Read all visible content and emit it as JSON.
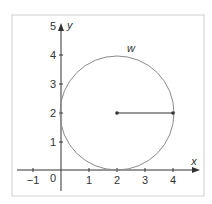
{
  "diagram": {
    "axes": {
      "x_label": "x",
      "y_label": "y",
      "x_ticks": [
        "−1",
        "0",
        "1",
        "2",
        "3",
        "4"
      ],
      "y_ticks": [
        "1",
        "2",
        "3",
        "4",
        "5"
      ]
    },
    "circle": {
      "label": "w",
      "center": [
        2,
        2
      ],
      "radius": 2,
      "radius_endpoint": [
        4,
        2
      ]
    },
    "colors": {
      "axis": "#333333",
      "circle": "#888888",
      "frame": "#cccccc"
    }
  }
}
